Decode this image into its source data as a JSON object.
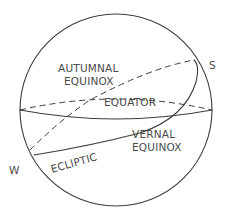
{
  "diagram": {
    "type": "celestial-sphere",
    "labels": {
      "autumnal_line1": "AUTUMNAL",
      "autumnal_line2": "EQUINOX",
      "equator": "EQUATOR",
      "vernal_line1": "VERNAL",
      "vernal_line2": "EQUINOX",
      "ecliptic": "ECLIPTIC",
      "south": "S",
      "west": "W"
    },
    "colors": {
      "stroke": "#3c3c3c",
      "text": "#4a4a4a",
      "background": "#ffffff"
    }
  }
}
